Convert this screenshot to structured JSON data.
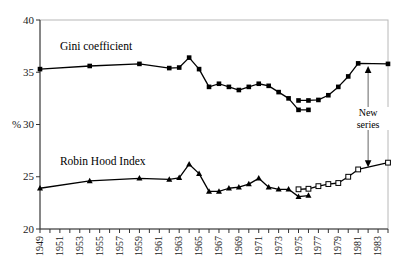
{
  "chart_data": {
    "type": "line",
    "title": "",
    "xlabel": "",
    "ylabel": "%",
    "ylim": [
      20,
      40
    ],
    "xlim": [
      1949,
      1984
    ],
    "yticks": [
      20,
      25,
      30,
      35,
      40
    ],
    "ytick_labels": [
      "20",
      "25",
      "30",
      "35",
      "40"
    ],
    "xticks": [
      1949,
      1950,
      1951,
      1952,
      1953,
      1954,
      1955,
      1956,
      1957,
      1958,
      1959,
      1960,
      1961,
      1962,
      1963,
      1964,
      1965,
      1966,
      1967,
      1968,
      1969,
      1970,
      1971,
      1972,
      1973,
      1974,
      1975,
      1976,
      1977,
      1978,
      1979,
      1980,
      1981,
      1982,
      1983,
      1984
    ],
    "xtick_labels": [
      "1949",
      "1951",
      "1953",
      "1955",
      "1957",
      "1959",
      "1961",
      "1963",
      "1965",
      "1967",
      "1969",
      "1971",
      "1973",
      "1975",
      "1977",
      "1979",
      "1981",
      "1983"
    ],
    "xtick_label_years": [
      1949,
      1951,
      1953,
      1955,
      1957,
      1959,
      1961,
      1963,
      1965,
      1967,
      1969,
      1971,
      1973,
      1975,
      1977,
      1979,
      1981,
      1983
    ],
    "grid": false,
    "legend_position": "inline-labels",
    "frame_color": "#b8b8b8",
    "line_color": "#000000",
    "series": [
      {
        "name": "Gini coefficient",
        "marker": "filled-square",
        "label_x": 1951.0,
        "label_y": 37.35,
        "segments": [
          {
            "id": "gini-old",
            "marker": "filled-square",
            "x": [
              1949,
              1954,
              1959,
              1962,
              1963,
              1964,
              1965,
              1966,
              1967,
              1968,
              1969,
              1970,
              1971,
              1972,
              1973,
              1974,
              1975,
              1976
            ],
            "y": [
              35.3,
              35.6,
              35.8,
              35.4,
              35.45,
              36.4,
              35.3,
              33.6,
              33.9,
              33.6,
              33.3,
              33.6,
              33.9,
              33.7,
              33.1,
              32.5,
              31.4,
              31.4
            ]
          },
          {
            "id": "gini-new",
            "marker": "filled-square",
            "x": [
              1975,
              1976,
              1977,
              1978,
              1979,
              1980,
              1981,
              1984
            ],
            "y": [
              32.3,
              32.3,
              32.35,
              32.8,
              33.6,
              34.6,
              35.85,
              35.8
            ]
          }
        ]
      },
      {
        "name": "Robin Hood Index",
        "marker": "filled-triangle",
        "label_x": 1951.0,
        "label_y": 26.3,
        "segments": [
          {
            "id": "rh-old",
            "marker": "filled-triangle",
            "x": [
              1949,
              1954,
              1959,
              1962,
              1963,
              1964,
              1965,
              1966,
              1967,
              1968,
              1969,
              1970,
              1971,
              1972,
              1973,
              1974,
              1975,
              1976
            ],
            "y": [
              23.9,
              24.6,
              24.85,
              24.75,
              24.9,
              26.2,
              25.3,
              23.6,
              23.6,
              23.9,
              24.0,
              24.3,
              24.85,
              24.0,
              23.8,
              23.8,
              23.1,
              23.2
            ]
          },
          {
            "id": "rh-new",
            "marker": "open-square",
            "x": [
              1975,
              1976,
              1977,
              1978,
              1979,
              1980,
              1981,
              1984
            ],
            "y": [
              23.8,
              23.85,
              24.1,
              24.3,
              24.4,
              25.0,
              25.7,
              26.35
            ]
          }
        ]
      }
    ],
    "annotations": [
      {
        "id": "new-series",
        "text_line1": "New",
        "text_line2": "series",
        "arrow": "double-headed-vertical",
        "x": 1982.0,
        "y_top": 35.6,
        "y_bottom": 25.9,
        "text_y": 30.6
      }
    ]
  },
  "axis": {
    "y_unit_label": "%"
  }
}
